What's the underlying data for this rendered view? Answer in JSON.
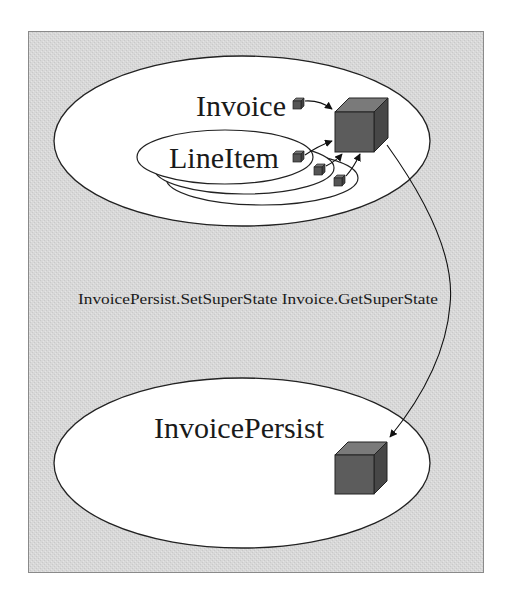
{
  "diagram": {
    "title": "",
    "colors": {
      "panel_bg": "#d9d9d9",
      "panel_border": "#8a8a8a",
      "ellipse_fill": "#ffffff",
      "stroke": "#222222",
      "cube_front": "#5a5a5a",
      "cube_top": "#787878",
      "cube_side": "#454545"
    },
    "nodes": [
      {
        "id": "invoice",
        "label": "Invoice",
        "shape": "ellipse"
      },
      {
        "id": "lineitem",
        "label": "LineItem",
        "shape": "ellipse",
        "stacked_count": 3,
        "parent": "invoice"
      },
      {
        "id": "invoicepersist",
        "label": "InvoicePersist",
        "shape": "ellipse"
      }
    ],
    "objects": [
      {
        "id": "invoice-state-cube",
        "kind": "large-cube",
        "in": "invoice"
      },
      {
        "id": "invoicepersist-state-cube",
        "kind": "large-cube",
        "in": "invoicepersist"
      },
      {
        "id": "invoice-item-cube",
        "kind": "small-cube",
        "in": "invoice"
      },
      {
        "id": "lineitem-item-cube-1",
        "kind": "small-cube",
        "in": "lineitem"
      },
      {
        "id": "lineitem-item-cube-2",
        "kind": "small-cube",
        "in": "lineitem"
      },
      {
        "id": "lineitem-item-cube-3",
        "kind": "small-cube",
        "in": "lineitem"
      }
    ],
    "edges": [
      {
        "from": "invoice-item-cube",
        "to": "invoice-state-cube"
      },
      {
        "from": "lineitem-item-cube-1",
        "to": "invoice-state-cube"
      },
      {
        "from": "lineitem-item-cube-2",
        "to": "invoice-state-cube"
      },
      {
        "from": "lineitem-item-cube-3",
        "to": "invoice-state-cube"
      },
      {
        "from": "invoice-state-cube",
        "to": "invoicepersist-state-cube",
        "label": "InvoicePersist.SetSuperState Invoice.GetSuperState"
      }
    ],
    "labels": {
      "invoice": "Invoice",
      "lineitem": "LineItem",
      "invoicepersist": "InvoicePersist",
      "transfer_edge": "InvoicePersist.SetSuperState Invoice.GetSuperState"
    }
  }
}
